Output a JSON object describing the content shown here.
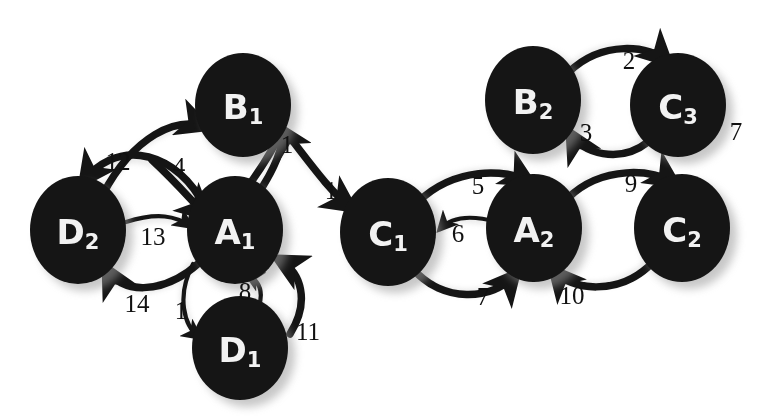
{
  "diagram": {
    "background_color": "#ffffff",
    "node_color": "#151515",
    "node_text_color": "#f2f2f2",
    "edge_color": "#151515",
    "label_color": "#111111",
    "nodes": [
      {
        "id": "B1",
        "letter": "B",
        "sub": "1",
        "cx": 243,
        "cy": 105,
        "rx": 48,
        "ry": 52
      },
      {
        "id": "D2",
        "letter": "D",
        "sub": "2",
        "cx": 78,
        "cy": 230,
        "rx": 48,
        "ry": 54
      },
      {
        "id": "A1",
        "letter": "A",
        "sub": "1",
        "cx": 235,
        "cy": 230,
        "rx": 48,
        "ry": 54
      },
      {
        "id": "D1",
        "letter": "D",
        "sub": "1",
        "cx": 240,
        "cy": 348,
        "rx": 48,
        "ry": 52
      },
      {
        "id": "C1",
        "letter": "C",
        "sub": "1",
        "cx": 388,
        "cy": 232,
        "rx": 48,
        "ry": 54
      },
      {
        "id": "A2",
        "letter": "A",
        "sub": "2",
        "cx": 534,
        "cy": 228,
        "rx": 48,
        "ry": 54
      },
      {
        "id": "C2",
        "letter": "C",
        "sub": "2",
        "cx": 682,
        "cy": 228,
        "rx": 48,
        "ry": 54
      },
      {
        "id": "B2",
        "letter": "B",
        "sub": "2",
        "cx": 533,
        "cy": 100,
        "rx": 48,
        "ry": 54
      },
      {
        "id": "C3",
        "letter": "C",
        "sub": "3",
        "cx": 678,
        "cy": 105,
        "rx": 48,
        "ry": 52
      }
    ],
    "edges": [
      {
        "id": "e1",
        "label": "12",
        "from": "A1",
        "to": "D2",
        "label_x": 118,
        "label_y": 161
      },
      {
        "id": "e2",
        "label": "4",
        "from": "D2",
        "to": "B1",
        "label_x": 179,
        "label_y": 166
      },
      {
        "id": "e3",
        "label": "1",
        "from": "A1",
        "to": "B1",
        "label_x": 287,
        "label_y": 144
      },
      {
        "id": "e4",
        "label": "1",
        "from": "B1",
        "to": "C1",
        "label_x": 331,
        "label_y": 190
      },
      {
        "id": "e5",
        "label": "13",
        "from": "D2",
        "to": "A1",
        "label_x": 153,
        "label_y": 236
      },
      {
        "id": "e6",
        "label": "14",
        "from": "A1",
        "to": "D2",
        "label_x": 137,
        "label_y": 303
      },
      {
        "id": "e7",
        "label": "1",
        "from": "A1",
        "to": "D1",
        "label_x": 181,
        "label_y": 310
      },
      {
        "id": "e8",
        "label": "8",
        "from": "D1",
        "to": "A1",
        "label_x": 245,
        "label_y": 291
      },
      {
        "id": "e9",
        "label": "11",
        "from": "D1",
        "to": "A1",
        "label_x": 308,
        "label_y": 331
      },
      {
        "id": "e10",
        "label": "5",
        "from": "C1",
        "to": "A2",
        "label_x": 478,
        "label_y": 185
      },
      {
        "id": "e11",
        "label": "6",
        "from": "A2",
        "to": "C1",
        "label_x": 458,
        "label_y": 233
      },
      {
        "id": "e12",
        "label": "7",
        "from": "C1",
        "to": "A2",
        "label_x": 483,
        "label_y": 296
      },
      {
        "id": "e13",
        "label": "9",
        "from": "A2",
        "to": "C2",
        "label_x": 631,
        "label_y": 183
      },
      {
        "id": "e14",
        "label": "10",
        "from": "C2",
        "to": "A2",
        "label_x": 572,
        "label_y": 295
      },
      {
        "id": "e15",
        "label": "2",
        "from": "B2",
        "to": "C3",
        "label_x": 629,
        "label_y": 60
      },
      {
        "id": "e16",
        "label": "3",
        "from": "C3",
        "to": "B2",
        "label_x": 586,
        "label_y": 132
      },
      {
        "id": "e17",
        "label": "7",
        "from": "C3",
        "to": "C3",
        "label_x": 736,
        "label_y": 131
      }
    ]
  }
}
